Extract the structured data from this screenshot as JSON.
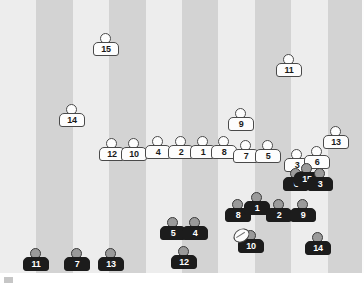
{
  "scene": {
    "title": "Rugby pitch player positions diagram",
    "width": 364,
    "height": 288,
    "pitch": {
      "label": "striped-grass-pitch",
      "top": 0,
      "height": 273,
      "stripe_count": 10,
      "stripe_width": 36.4,
      "stripe_colors": [
        "#ededed",
        "#d3d3d3"
      ],
      "background": "#ebebeb"
    },
    "marker": {
      "label": "bottom-left-marker",
      "color": "#c6c6c6"
    }
  },
  "teams": {
    "white": {
      "name": "white-team",
      "shirt": "#fdfdfd",
      "number_color": "#1a1a1a",
      "outline": "#4a4a4a"
    },
    "dark": {
      "name": "dark-team",
      "shirt": "#1c1c1c",
      "number_color": "#ffffff",
      "head": "#9a9a9a"
    }
  },
  "ball": {
    "label": "rugby-ball",
    "holder_team": "dark",
    "holder_number": "10",
    "color": "#fbfbfb"
  },
  "players": [
    {
      "team": "white",
      "number": "15",
      "x": 93,
      "y": 33
    },
    {
      "team": "white",
      "number": "11",
      "x": 276,
      "y": 54
    },
    {
      "team": "white",
      "number": "14",
      "x": 59,
      "y": 104
    },
    {
      "team": "white",
      "number": "9",
      "x": 228,
      "y": 108
    },
    {
      "team": "white",
      "number": "13",
      "x": 323,
      "y": 126
    },
    {
      "team": "white",
      "number": "12",
      "x": 99,
      "y": 138
    },
    {
      "team": "white",
      "number": "10",
      "x": 121,
      "y": 138
    },
    {
      "team": "white",
      "number": "4",
      "x": 145,
      "y": 136
    },
    {
      "team": "white",
      "number": "2",
      "x": 168,
      "y": 136
    },
    {
      "team": "white",
      "number": "1",
      "x": 190,
      "y": 136
    },
    {
      "team": "white",
      "number": "8",
      "x": 211,
      "y": 136
    },
    {
      "team": "white",
      "number": "7",
      "x": 233,
      "y": 140
    },
    {
      "team": "white",
      "number": "5",
      "x": 255,
      "y": 140
    },
    {
      "team": "white",
      "number": "3",
      "x": 284,
      "y": 149
    },
    {
      "team": "white",
      "number": "6",
      "x": 304,
      "y": 146
    },
    {
      "team": "dark",
      "number": "6",
      "x": 283,
      "y": 168
    },
    {
      "team": "dark",
      "number": "15",
      "x": 294,
      "y": 163
    },
    {
      "team": "dark",
      "number": "3",
      "x": 307,
      "y": 168
    },
    {
      "team": "dark",
      "number": "8",
      "x": 225,
      "y": 199
    },
    {
      "team": "dark",
      "number": "1",
      "x": 244,
      "y": 192
    },
    {
      "team": "dark",
      "number": "2",
      "x": 266,
      "y": 199
    },
    {
      "team": "dark",
      "number": "9",
      "x": 290,
      "y": 199
    },
    {
      "team": "dark",
      "number": "10",
      "x": 238,
      "y": 230
    },
    {
      "team": "dark",
      "number": "14",
      "x": 305,
      "y": 232
    },
    {
      "team": "dark",
      "number": "5",
      "x": 160,
      "y": 217
    },
    {
      "team": "dark",
      "number": "4",
      "x": 182,
      "y": 217
    },
    {
      "team": "dark",
      "number": "12",
      "x": 171,
      "y": 246
    },
    {
      "team": "dark",
      "number": "11",
      "x": 23,
      "y": 248
    },
    {
      "team": "dark",
      "number": "7",
      "x": 64,
      "y": 248
    },
    {
      "team": "dark",
      "number": "13",
      "x": 98,
      "y": 248
    }
  ]
}
